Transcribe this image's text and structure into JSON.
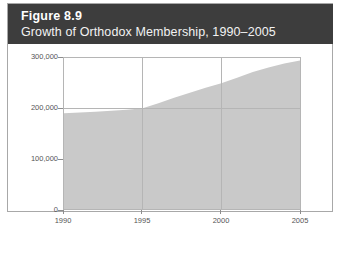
{
  "figure": {
    "number_label": "Figure 8.9",
    "subtitle": "Growth of Orthodox Membership, 1990–2005",
    "header_color": "#3d3d3d",
    "header_text_color": "#ffffff",
    "border_color": "#a8a8a8"
  },
  "chart_data": {
    "type": "area",
    "title": "Growth of Orthodox Membership, 1990–2005",
    "xlabel": "",
    "ylabel": "",
    "x": [
      1990,
      1991,
      1992,
      1993,
      1994,
      1995,
      1996,
      1997,
      1998,
      1999,
      2000,
      2001,
      2002,
      2003,
      2004,
      2005
    ],
    "values": [
      190000,
      191500,
      193000,
      195000,
      197000,
      200000,
      210000,
      221000,
      231000,
      241000,
      250000,
      261000,
      272000,
      281000,
      289000,
      295000
    ],
    "series": [
      {
        "name": "Orthodox Membership",
        "values": [
          190000,
          191500,
          193000,
          195000,
          197000,
          200000,
          210000,
          221000,
          231000,
          241000,
          250000,
          261000,
          272000,
          281000,
          289000,
          295000
        ]
      }
    ],
    "xlim": [
      1990,
      2005
    ],
    "ylim": [
      0,
      300000
    ],
    "x_tick_values": [
      1990,
      1995,
      2000,
      2005
    ],
    "x_tick_labels": [
      "1990",
      "1995",
      "2000",
      "2005"
    ],
    "y_tick_values": [
      0,
      100000,
      200000,
      300000
    ],
    "y_tick_labels": [
      "0",
      "100,000",
      "200,000",
      "300,000"
    ],
    "grid": {
      "vertical_at": [
        1995,
        2000
      ],
      "horizontal_at": [
        300000,
        200000
      ],
      "color": "#b5b5b5"
    },
    "legend": null,
    "legend_position": "none",
    "area_fill_color": "#c9c9c9",
    "plot_background": "#ffffff",
    "axis_color": "#b5b5b5",
    "tick_label_color": "#555555"
  }
}
